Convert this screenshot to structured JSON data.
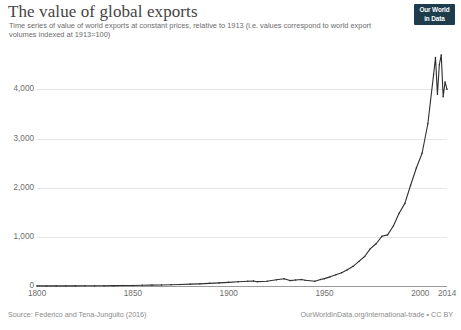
{
  "header": {
    "title": "The value of global exports",
    "subtitle": "Time series of value of world exports at constant prices, relative to 1913 (i.e. values correspond to world export volumes indexed at 1913=100)"
  },
  "logo": {
    "line1": "Our World",
    "line2": "in Data"
  },
  "footer": {
    "source": "Source: Federico and Tena-Junguito (2016)",
    "credit": "OurWorldInData.org/international-trade • CC BY"
  },
  "chart_data": {
    "type": "line",
    "title": "The value of global exports",
    "subtitle": "Time series of value of world exports at constant prices, relative to 1913 (i.e. values correspond to world export volumes indexed at 1913=100)",
    "xlabel": "",
    "ylabel": "",
    "xlim": [
      1800,
      2014
    ],
    "ylim": [
      0,
      4800
    ],
    "grid": true,
    "legend": false,
    "line_color": "#2f2f2f",
    "xticks": [
      1800,
      1850,
      1900,
      1950,
      2000,
      2014
    ],
    "xtick_labels": [
      "1800",
      "1850",
      "1900",
      "1950",
      "2000",
      "2014"
    ],
    "yticks": [
      0,
      1000,
      2000,
      3000,
      4000
    ],
    "ytick_labels": [
      "0",
      "1,000",
      "2,000",
      "3,000",
      "4,000"
    ],
    "series": [
      {
        "name": "World exports (1913=100)",
        "x": [
          1800,
          1805,
          1810,
          1815,
          1820,
          1825,
          1830,
          1835,
          1840,
          1845,
          1850,
          1855,
          1860,
          1865,
          1870,
          1875,
          1880,
          1885,
          1890,
          1895,
          1900,
          1905,
          1910,
          1913,
          1915,
          1920,
          1925,
          1929,
          1932,
          1935,
          1938,
          1940,
          1945,
          1948,
          1950,
          1953,
          1956,
          1959,
          1962,
          1965,
          1968,
          1971,
          1974,
          1977,
          1980,
          1983,
          1986,
          1989,
          1992,
          1995,
          1998,
          2001,
          2004,
          2007,
          2008,
          2009,
          2010,
          2011,
          2012,
          2013,
          2014
        ],
        "y": [
          2,
          2,
          2,
          3,
          3,
          4,
          5,
          6,
          7,
          9,
          11,
          14,
          18,
          21,
          26,
          31,
          38,
          44,
          54,
          63,
          74,
          86,
          96,
          100,
          88,
          96,
          126,
          148,
          110,
          122,
          132,
          118,
          96,
          132,
          150,
          186,
          228,
          268,
          330,
          400,
          500,
          600,
          760,
          860,
          1010,
          1040,
          1220,
          1480,
          1680,
          2050,
          2400,
          2700,
          3300,
          4300,
          4650,
          3900,
          4500,
          4700,
          3850,
          4150,
          4000
        ]
      }
    ],
    "annotations": []
  }
}
